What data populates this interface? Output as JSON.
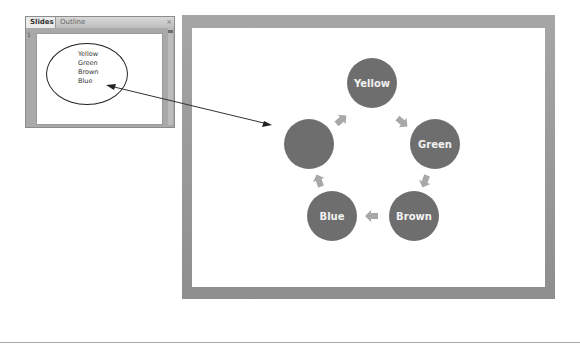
{
  "slides_panel": {
    "tabs": [
      {
        "label": "Slides",
        "active": true
      },
      {
        "label": "Outline",
        "active": false
      }
    ],
    "close_glyph": "×",
    "slide_number": "1",
    "thumbnail": {
      "items": [
        "Yellow",
        "Green",
        "Brown",
        "Blue"
      ]
    }
  },
  "main_slide": {
    "cycle_nodes": [
      {
        "label": "Yellow"
      },
      {
        "label": "Green"
      },
      {
        "label": "Brown"
      },
      {
        "label": "Blue"
      },
      {
        "label": ""
      }
    ],
    "node_color": "#6e6e6e",
    "arrow_color": "#a8a8a8"
  },
  "connector": {
    "type": "double-headed-arrow"
  }
}
